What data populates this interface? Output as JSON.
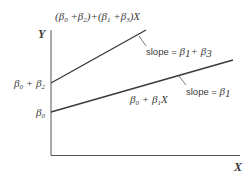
{
  "diagram": {
    "type": "linear regression with interaction term",
    "axes": {
      "x_label": "X",
      "y_label": "Y"
    },
    "lines": [
      {
        "name": "upper-line",
        "equation": {
          "parts": [
            "(β",
            "0",
            " +β",
            "2",
            ")+(β",
            "1",
            " +β",
            "3",
            ")X"
          ]
        },
        "intercept_label": {
          "a": "β",
          "a_sub": "0",
          "mid": " + β",
          "b_sub": "2"
        },
        "slope_label": {
          "prefix": "slope = ",
          "a": "β",
          "a_sub": "1",
          "mid": "+ β",
          "b_sub": "3"
        },
        "start": [
          51,
          83
        ],
        "end": [
          146,
          30
        ]
      },
      {
        "name": "lower-line",
        "equation": {
          "a": "β",
          "a_sub": "0",
          "mid": " + β",
          "b_sub": "1",
          "suffix": "X"
        },
        "intercept_label": {
          "a": "β",
          "a_sub": "0"
        },
        "slope_label": {
          "prefix": "slope = ",
          "a": "β",
          "a_sub": "1"
        },
        "start": [
          51,
          112
        ],
        "end": [
          233,
          60
        ]
      }
    ],
    "colors": {
      "line": "#3a3a3a",
      "axis": "#555555",
      "text": "#3a3a3a",
      "background": "#ffffff"
    }
  }
}
